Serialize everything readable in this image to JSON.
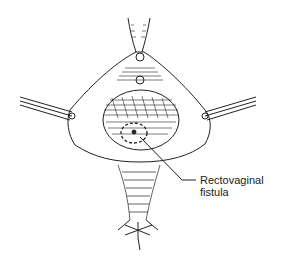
{
  "figure": {
    "labels": [
      {
        "text": "Rectovaginal",
        "line2": "fistula"
      }
    ],
    "colors": {
      "ink": "#222222",
      "background": "#ffffff"
    }
  }
}
